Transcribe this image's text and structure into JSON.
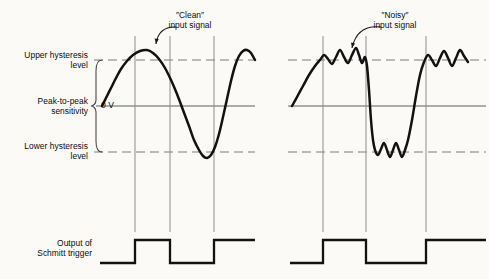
{
  "figure": {
    "title_visible": false,
    "background_color": "#fbfaf7",
    "ink_color": "#121212",
    "gridline_color": "#8d8d8d",
    "dashed_level_color": "#7b7b7b"
  },
  "axis_labels": {
    "upper_hysteresis": "Upper hysteresis\nlevel",
    "peak_to_peak": "Peak-to-peak\nsensitivity",
    "lower_hysteresis": "Lower hysteresis\nlevel",
    "zero_volts": "0 V",
    "output_label": "Output of\nSchmitt trigger"
  },
  "callouts": [
    {
      "name": "clean-input-signal",
      "text": "″Clean″\ninput signal",
      "text_x": 184,
      "text_y": 12,
      "arrow_from_x": 176,
      "arrow_from_y": 27,
      "arrow_to_x": 156,
      "arrow_to_y": 44
    },
    {
      "name": "noisy-input-signal",
      "text": "″Noisy″\ninput signal",
      "text_x": 390,
      "text_y": 12,
      "arrow_from_x": 381,
      "arrow_from_y": 27,
      "arrow_to_x": 352,
      "arrow_to_y": 48
    }
  ],
  "chart_data": {
    "type": "line",
    "xlabel": "",
    "ylabel": "",
    "grid": true,
    "legend_position": "none",
    "levels": {
      "upper_hysteresis_y": 60,
      "zero_volt_y": 106,
      "lower_hysteresis_y": 152,
      "upper_hysteresis_style": "dashed",
      "zero_volt_style": "solid",
      "lower_hysteresis_style": "solid-thin"
    },
    "panels": [
      {
        "name": "clean",
        "signal_label": "″Clean″ input signal",
        "plot_x_range": [
          100,
          239
        ],
        "trigger_gridlines_x": [
          135,
          170,
          214
        ],
        "input_points": [
          [
            102,
            106
          ],
          [
            106,
            98
          ],
          [
            111,
            88
          ],
          [
            116,
            78
          ],
          [
            121,
            69
          ],
          [
            127,
            61
          ],
          [
            133,
            55
          ],
          [
            140,
            51
          ],
          [
            147,
            50
          ],
          [
            153,
            53
          ],
          [
            159,
            59
          ],
          [
            165,
            68
          ],
          [
            171,
            80
          ],
          [
            177,
            94
          ],
          [
            183,
            110
          ],
          [
            189,
            126
          ],
          [
            194,
            140
          ],
          [
            199,
            150
          ],
          [
            203,
            156
          ],
          [
            207,
            158
          ],
          [
            211,
            155
          ],
          [
            215,
            147
          ],
          [
            219,
            134
          ],
          [
            223,
            117
          ],
          [
            227,
            99
          ],
          [
            231,
            81
          ],
          [
            235,
            66
          ],
          [
            239,
            56
          ],
          [
            243,
            51
          ],
          [
            247,
            50
          ],
          [
            251,
            53
          ],
          [
            255,
            60
          ]
        ],
        "output_waveform": {
          "low_y": 263,
          "high_y": 240,
          "start_x": 100,
          "end_x": 239,
          "transitions_x": [
            135,
            170,
            214
          ]
        }
      },
      {
        "name": "noisy",
        "signal_label": "″Noisy″ input signal",
        "plot_x_range": [
          290,
          470
        ],
        "trigger_gridlines_x": [
          323,
          366,
          426
        ],
        "input_points": [
          [
            292,
            106
          ],
          [
            297,
            97
          ],
          [
            303,
            86
          ],
          [
            309,
            75
          ],
          [
            315,
            66
          ],
          [
            320,
            60
          ],
          [
            324,
            55
          ],
          [
            328,
            59
          ],
          [
            332,
            64
          ],
          [
            336,
            57
          ],
          [
            340,
            50
          ],
          [
            344,
            57
          ],
          [
            348,
            63
          ],
          [
            352,
            55
          ],
          [
            356,
            48
          ],
          [
            359,
            55
          ],
          [
            362,
            63
          ],
          [
            365,
            57
          ],
          [
            367,
            66
          ],
          [
            369,
            90
          ],
          [
            371,
            120
          ],
          [
            373,
            140
          ],
          [
            375,
            150
          ],
          [
            378,
            155
          ],
          [
            381,
            149
          ],
          [
            384,
            143
          ],
          [
            387,
            150
          ],
          [
            390,
            157
          ],
          [
            393,
            150
          ],
          [
            396,
            143
          ],
          [
            399,
            150
          ],
          [
            402,
            157
          ],
          [
            405,
            150
          ],
          [
            408,
            140
          ],
          [
            412,
            120
          ],
          [
            416,
            96
          ],
          [
            420,
            75
          ],
          [
            424,
            62
          ],
          [
            428,
            55
          ],
          [
            432,
            60
          ],
          [
            436,
            66
          ],
          [
            440,
            58
          ],
          [
            444,
            51
          ],
          [
            448,
            58
          ],
          [
            452,
            66
          ],
          [
            456,
            58
          ],
          [
            460,
            50
          ],
          [
            464,
            56
          ],
          [
            468,
            62
          ]
        ],
        "output_waveform": {
          "low_y": 263,
          "high_y": 240,
          "start_x": 290,
          "end_x": 470,
          "transitions_x": [
            323,
            366,
            426
          ]
        }
      }
    ],
    "brace": {
      "x": 96,
      "top_y": 60,
      "bottom_y": 152,
      "label": "Peak-to-peak sensitivity"
    },
    "annotations": [
      "Upper hysteresis level",
      "Lower hysteresis level",
      "Peak-to-peak sensitivity",
      "0 V",
      "Output of Schmitt trigger",
      "″Clean″ input signal",
      "″Noisy″ input signal"
    ]
  }
}
